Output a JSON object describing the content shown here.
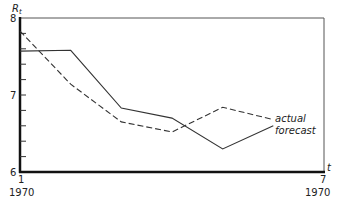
{
  "chart_data": {
    "type": "line",
    "title": "",
    "ylabel": "R_t",
    "xlabel": "t",
    "x": [
      1,
      2,
      3,
      4,
      5,
      6
    ],
    "ylim": [
      6,
      8
    ],
    "xlim": [
      1,
      7
    ],
    "yticks_major": [
      "6",
      "7",
      "8"
    ],
    "ytick_minor_step": 0.2,
    "x_tick_labels": [
      {
        "t": "1",
        "year": "1970"
      },
      {
        "t": "7",
        "year": "1970"
      }
    ],
    "grid": false,
    "frame": "box",
    "series": [
      {
        "name": "actual",
        "style": "dashed",
        "values": [
          7.83,
          7.14,
          6.65,
          6.52,
          6.84,
          6.68
        ]
      },
      {
        "name": "forecast",
        "style": "solid",
        "x": [
          1,
          2,
          3,
          4,
          5,
          6
        ],
        "values": [
          7.57,
          7.58,
          6.83,
          6.7,
          6.3,
          6.6
        ]
      }
    ],
    "annotations": [
      {
        "text": "actual",
        "attached_to": "actual",
        "position": "end of line, right"
      },
      {
        "text": "forecast",
        "attached_to": "forecast",
        "position": "end of line, right"
      }
    ]
  },
  "labels": {
    "y_axis": "R",
    "y_axis_sub": "t",
    "x_axis": "t",
    "y8": "8",
    "y7": "7",
    "y6": "6",
    "x_start_t": "1",
    "x_start_year": "1970",
    "x_end_t": "7",
    "x_end_year": "1970",
    "legend_actual": "actual",
    "legend_forecast": "forecast"
  }
}
